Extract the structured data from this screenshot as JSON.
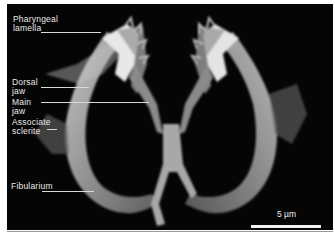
{
  "figure": {
    "type": "SEM micrograph",
    "background_color": "#050505",
    "label_color": "#eaeaea",
    "labels": [
      {
        "text": "Pharyngeal\nlamella",
        "id": "pharyngeal-lamella"
      },
      {
        "text": "Dorsal\njaw",
        "id": "dorsal-jaw"
      },
      {
        "text": "Main\njaw",
        "id": "main-jaw"
      },
      {
        "text": "Associate\nsclerite",
        "id": "associate-sclerite"
      },
      {
        "text": "Fibularium",
        "id": "fibularium"
      }
    ],
    "scale_bar": {
      "label": "5 µm"
    }
  }
}
